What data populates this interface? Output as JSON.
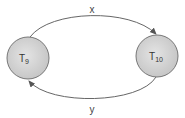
{
  "diagram": {
    "nodes": [
      {
        "id": "T9",
        "label": "T",
        "subscript": "9"
      },
      {
        "id": "T10",
        "label": "T",
        "subscript": "10"
      }
    ],
    "edges": [
      {
        "from": "T9",
        "to": "T10",
        "label": "x"
      },
      {
        "from": "T10",
        "to": "T9",
        "label": "y"
      }
    ],
    "colors": {
      "node_fill": "#d6d6d6",
      "node_stroke": "#777777",
      "edge": "#555555"
    }
  }
}
